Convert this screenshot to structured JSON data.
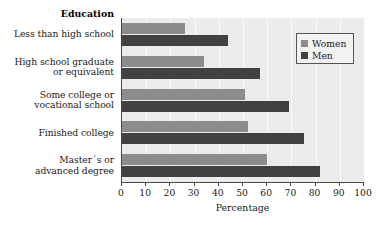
{
  "chart_data": {
    "type": "bar",
    "orientation": "horizontal",
    "title": "Education",
    "xlabel": "Percentage",
    "ylabel": "",
    "xlim": [
      0,
      100
    ],
    "xticks": [
      0,
      10,
      20,
      30,
      40,
      50,
      60,
      70,
      80,
      90,
      100
    ],
    "grid": true,
    "grid_axis": "x",
    "legend_position": "upper right",
    "categories": [
      "Less than high school",
      "High school graduate or equivalent",
      "Some college or vocational school",
      "Finished college",
      "Master's or advanced degree"
    ],
    "category_lines": [
      [
        "Less than high school"
      ],
      [
        "High school graduate",
        "or equivalent"
      ],
      [
        "Some college or",
        "vocational school"
      ],
      [
        "Finished college"
      ],
      [
        "Master´s or",
        "advanced degree"
      ]
    ],
    "series": [
      {
        "name": "Women",
        "color": "#8c8c8c",
        "values": [
          26,
          34,
          51,
          52,
          60
        ]
      },
      {
        "name": "Men",
        "color": "#414141",
        "values": [
          44,
          57,
          69,
          75,
          82
        ]
      }
    ]
  },
  "legend": {
    "entries": [
      {
        "label": "Women",
        "color": "#8c8c8c"
      },
      {
        "label": "Men",
        "color": "#414141"
      }
    ]
  },
  "colors": {
    "plot_background": "#ebebeb",
    "gridline": "#fbfbfb",
    "axis": "#4a4a4a",
    "text": "#1a1a1a",
    "page_background": "#ffffff"
  }
}
